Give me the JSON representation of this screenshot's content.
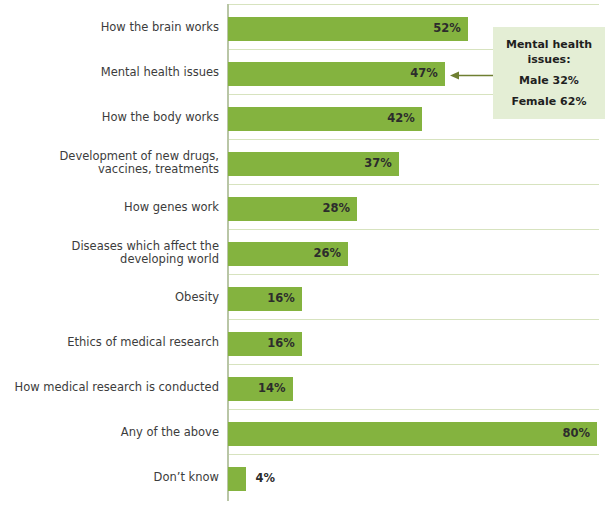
{
  "chart_data": {
    "type": "bar",
    "orientation": "horizontal",
    "title": "",
    "xlabel": "",
    "ylabel": "",
    "xlim": [
      0,
      80
    ],
    "grid": true,
    "legend": "none",
    "value_suffix": "%",
    "categories": [
      "How the brain works",
      "Mental health issues",
      "How the body works",
      "Development of new drugs, vaccines, treatments",
      "How genes work",
      "Diseases which affect the developing world",
      "Obesity",
      "Ethics of medical research",
      "How medical research is conducted",
      "Any of the above",
      "Don't know"
    ],
    "values": [
      52,
      47,
      42,
      37,
      28,
      26,
      16,
      16,
      14,
      80,
      4
    ],
    "value_labels": [
      "52%",
      "47%",
      "42%",
      "37%",
      "28%",
      "26%",
      "16%",
      "16%",
      "14%",
      "80%",
      "4%"
    ],
    "bar_color": "#84b33f",
    "annotations": [
      {
        "target_category": "Mental health issues",
        "lines": [
          "Mental health",
          "issues:",
          "Male 32%",
          "Female 62%"
        ],
        "background": "#e4eed5",
        "arrow": "left-pointing-arrow"
      }
    ]
  },
  "bars": [
    {
      "label_line1": "How the brain works",
      "label_line2": "",
      "value_label": "52%",
      "value": 52
    },
    {
      "label_line1": "Mental health issues",
      "label_line2": "",
      "value_label": "47%",
      "value": 47
    },
    {
      "label_line1": "How the body works",
      "label_line2": "",
      "value_label": "42%",
      "value": 42
    },
    {
      "label_line1": "Development of new drugs,",
      "label_line2": "vaccines, treatments",
      "value_label": "37%",
      "value": 37
    },
    {
      "label_line1": "How genes work",
      "label_line2": "",
      "value_label": "28%",
      "value": 28
    },
    {
      "label_line1": "Diseases which affect the",
      "label_line2": "developing world",
      "value_label": "26%",
      "value": 26
    },
    {
      "label_line1": "Obesity",
      "label_line2": "",
      "value_label": "16%",
      "value": 16
    },
    {
      "label_line1": "Ethics of medical research",
      "label_line2": "",
      "value_label": "16%",
      "value": 16
    },
    {
      "label_line1": "How medical research is conducted",
      "label_line2": "",
      "value_label": "14%",
      "value": 14
    },
    {
      "label_line1": "Any of the above",
      "label_line2": "",
      "value_label": "80%",
      "value": 80
    },
    {
      "label_line1": "Don’t know",
      "label_line2": "",
      "value_label": "4%",
      "value": 4
    }
  ],
  "callout": {
    "title_line1": "Mental health",
    "title_line2": "issues:",
    "male": "Male 32%",
    "female": "Female 62%"
  }
}
